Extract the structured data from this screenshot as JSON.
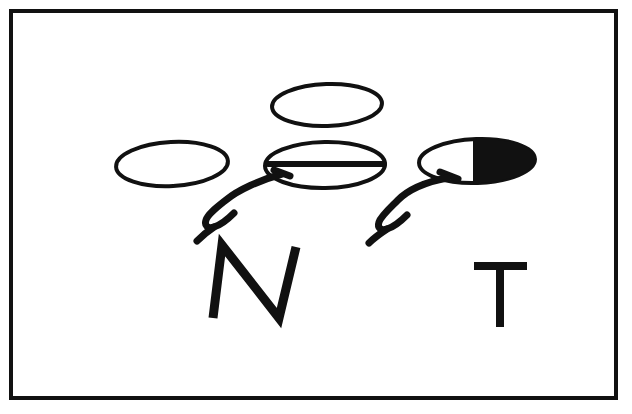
{
  "figure": {
    "background_color": "#ffffff",
    "ink_color": "#111111",
    "frame": {
      "name": "border-frame",
      "x": 11,
      "y": 11,
      "width": 605,
      "height": 387,
      "stroke_width": 4,
      "stroke_color": "#111111",
      "fill_color": "#ffffff"
    },
    "shapes": [
      {
        "id": "top-ellipse",
        "label": "top oval",
        "cx": 327,
        "cy": 105,
        "rx": 55,
        "ry": 21,
        "rotation": -2,
        "fill": "#ffffff",
        "stroke": "#111111",
        "stroke_width": 4,
        "inner_line": false,
        "half_filled": false
      },
      {
        "id": "left-ellipse",
        "label": "left oval",
        "cx": 172,
        "cy": 164,
        "rx": 56,
        "ry": 22,
        "rotation": -3,
        "fill": "#ffffff",
        "stroke": "#111111",
        "stroke_width": 4,
        "inner_line": false,
        "half_filled": false
      },
      {
        "id": "center-ellipse",
        "label": "center oval with equator line",
        "cx": 325,
        "cy": 165,
        "rx": 60,
        "ry": 23,
        "rotation": -1,
        "fill": "#ffffff",
        "stroke": "#111111",
        "stroke_width": 4,
        "inner_line": true,
        "inner_line_y": 164,
        "inner_line_x1": 268,
        "inner_line_x2": 384,
        "inner_line_width": 6,
        "half_filled": false
      },
      {
        "id": "right-ellipse",
        "label": "right oval half filled black",
        "cx": 477,
        "cy": 161,
        "rx": 58,
        "ry": 22,
        "rotation": -2,
        "fill": "#ffffff",
        "stroke": "#111111",
        "stroke_width": 4,
        "inner_line": false,
        "half_filled": true,
        "fill_start_x": 475,
        "fill_color": "#111111",
        "divider_x": 475,
        "divider_width": 4
      }
    ],
    "pointers": [
      {
        "id": "left-pointer",
        "label": "left curved pointer line to center oval",
        "stroke": "#111111",
        "stroke_width": 7,
        "path": "M 282 174 C 260 180 238 190 226 200 C 216 208 208 214 206 220 C 204 226 208 229 214 227 C 221 225 228 219 234 213",
        "hook_path": "M 214 227 C 208 231 202 236 197 241"
      },
      {
        "id": "right-pointer",
        "label": "right curved pointer line to right oval",
        "stroke": "#111111",
        "stroke_width": 7,
        "path": "M 447 178 C 426 182 408 190 398 200 C 389 209 381 216 379 222 C 377 228 381 231 387 229 C 394 227 401 221 407 215",
        "hook_path": "M 387 229 C 381 233 374 238 369 243"
      }
    ],
    "pointer_tips": [
      {
        "id": "left-pointer-tip",
        "label": "tip bar touching center oval",
        "x1": 274,
        "y1": 170,
        "x2": 290,
        "y2": 176,
        "stroke_width": 7
      },
      {
        "id": "right-pointer-tip",
        "label": "tip bar touching right oval",
        "x1": 440,
        "y1": 172,
        "x2": 458,
        "y2": 179,
        "stroke_width": 7
      }
    ],
    "labels": [
      {
        "id": "label-n",
        "text": "N",
        "meaning": "N",
        "x": 255,
        "y": 282,
        "stroke_width": 9,
        "stroke": "#111111",
        "path": "M 213 318 L 222 245 L 279 318 L 296 247"
      },
      {
        "id": "label-t",
        "text": "T",
        "meaning": "T",
        "x": 500,
        "y": 293,
        "stroke_width": 8,
        "stroke": "#111111",
        "path_horizontal": "M 474 266 L 527 266",
        "path_vertical": "M 500 266 L 500 327"
      }
    ]
  }
}
